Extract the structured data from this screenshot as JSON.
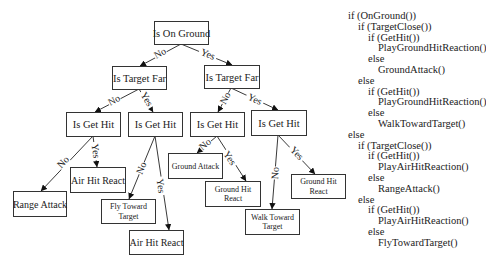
{
  "diagram": {
    "nodes": [
      {
        "id": "root",
        "lines": [
          "Is On Ground"
        ],
        "x": 154,
        "y": 21,
        "w": 54,
        "h": 23,
        "fs": 10.5
      },
      {
        "id": "far_l",
        "lines": [
          "Is Target Far"
        ],
        "x": 112,
        "y": 66,
        "w": 54,
        "h": 23,
        "fs": 10.5
      },
      {
        "id": "far_r",
        "lines": [
          "Is Target Far"
        ],
        "x": 204,
        "y": 65,
        "w": 55,
        "h": 23,
        "fs": 10.5
      },
      {
        "id": "hit_1",
        "lines": [
          "Is Get Hit"
        ],
        "x": 66,
        "y": 112,
        "w": 54,
        "h": 24,
        "fs": 10.5
      },
      {
        "id": "hit_2",
        "lines": [
          "Is Get Hit"
        ],
        "x": 128,
        "y": 112,
        "w": 54,
        "h": 24,
        "fs": 10.5
      },
      {
        "id": "hit_3",
        "lines": [
          "Is Get Hit"
        ],
        "x": 190,
        "y": 112,
        "w": 54,
        "h": 24,
        "fs": 10.5
      },
      {
        "id": "hit_4",
        "lines": [
          "Is Get Hit"
        ],
        "x": 251,
        "y": 110,
        "w": 55,
        "h": 25,
        "fs": 10.5
      },
      {
        "id": "air_hit_1",
        "lines": [
          "Air Hit React"
        ],
        "x": 70,
        "y": 167,
        "w": 55,
        "h": 25,
        "fs": 10
      },
      {
        "id": "range_attack",
        "lines": [
          "Range Attack"
        ],
        "x": 13,
        "y": 191,
        "w": 53,
        "h": 25,
        "fs": 10
      },
      {
        "id": "fly_toward",
        "lines": [
          "Fly Toward",
          "Target"
        ],
        "x": 101,
        "y": 199,
        "w": 54,
        "h": 24,
        "fs": 8
      },
      {
        "id": "air_hit_2",
        "lines": [
          "Air Hit React"
        ],
        "x": 129,
        "y": 230,
        "w": 54,
        "h": 24,
        "fs": 10
      },
      {
        "id": "ground_attack",
        "lines": [
          "Ground Attack"
        ],
        "x": 168,
        "y": 153,
        "w": 54,
        "h": 25,
        "fs": 8
      },
      {
        "id": "ground_hit_1",
        "lines": [
          "Ground Hit",
          "React"
        ],
        "x": 205,
        "y": 181,
        "w": 55,
        "h": 25,
        "fs": 8
      },
      {
        "id": "walk_toward",
        "lines": [
          "Walk Toward",
          "Target"
        ],
        "x": 245,
        "y": 209,
        "w": 54,
        "h": 25,
        "fs": 8
      },
      {
        "id": "ground_hit_2",
        "lines": [
          "Ground Hit",
          "React"
        ],
        "x": 291,
        "y": 174,
        "w": 54,
        "h": 24,
        "fs": 8
      }
    ],
    "edges": [
      {
        "from": [
          181,
          44
        ],
        "to": [
          140,
          66
        ],
        "label": "No",
        "lx": 160,
        "ly": 53
      },
      {
        "from": [
          181,
          44
        ],
        "to": [
          232,
          65
        ],
        "label": "Yes",
        "lx": 208,
        "ly": 54
      },
      {
        "from": [
          139,
          89
        ],
        "to": [
          95,
          112
        ],
        "label": "No",
        "lx": 114,
        "ly": 100
      },
      {
        "from": [
          139,
          89
        ],
        "to": [
          153,
          112
        ],
        "label": "Yes",
        "lx": 147,
        "ly": 99
      },
      {
        "from": [
          231,
          88
        ],
        "to": [
          218,
          112
        ],
        "label": "No",
        "lx": 225,
        "ly": 98
      },
      {
        "from": [
          231,
          88
        ],
        "to": [
          278,
          110
        ],
        "label": "Yes",
        "lx": 255,
        "ly": 99
      },
      {
        "from": [
          93,
          136
        ],
        "to": [
          41,
          191
        ],
        "label": "No",
        "lx": 63,
        "ly": 162
      },
      {
        "from": [
          93,
          136
        ],
        "to": [
          97,
          167
        ],
        "label": "Yes",
        "lx": 96,
        "ly": 151
      },
      {
        "from": [
          155,
          136
        ],
        "to": [
          129,
          199
        ],
        "label": "No",
        "lx": 141,
        "ly": 168
      },
      {
        "from": [
          155,
          136
        ],
        "to": [
          169,
          230
        ],
        "label": "Yes",
        "lx": 161,
        "ly": 186
      },
      {
        "from": [
          217,
          136
        ],
        "to": [
          197,
          153
        ],
        "label": "No",
        "lx": 205,
        "ly": 144
      },
      {
        "from": [
          217,
          136
        ],
        "to": [
          246,
          181
        ],
        "label": "Yes",
        "lx": 230,
        "ly": 158
      },
      {
        "from": [
          278,
          135
        ],
        "to": [
          272,
          209
        ],
        "label": "No",
        "lx": 275,
        "ly": 173
      },
      {
        "from": [
          278,
          135
        ],
        "to": [
          315,
          174
        ],
        "label": "Yes",
        "lx": 297,
        "ly": 153
      }
    ]
  },
  "code": {
    "lines": [
      {
        "indent": 0,
        "text": "if (OnGround())"
      },
      {
        "indent": 1,
        "text": "if (TargetClose())"
      },
      {
        "indent": 2,
        "text": "if (GetHit())"
      },
      {
        "indent": 3,
        "text": "PlayGroundHitReaction()"
      },
      {
        "indent": 2,
        "text": "else"
      },
      {
        "indent": 3,
        "text": "GroundAttack()"
      },
      {
        "indent": 1,
        "text": "else"
      },
      {
        "indent": 2,
        "text": "if (GetHit())"
      },
      {
        "indent": 3,
        "text": "PlayGroundHitReaction()"
      },
      {
        "indent": 2,
        "text": "else"
      },
      {
        "indent": 3,
        "text": "WalkTowardTarget()"
      },
      {
        "indent": 0,
        "text": "else"
      },
      {
        "indent": 1,
        "text": "if (TargetClose())"
      },
      {
        "indent": 2,
        "text": "if (GetHit())"
      },
      {
        "indent": 3,
        "text": "PlayAirHitReaction()"
      },
      {
        "indent": 2,
        "text": "else"
      },
      {
        "indent": 3,
        "text": "RangeAttack()"
      },
      {
        "indent": 1,
        "text": "else"
      },
      {
        "indent": 2,
        "text": "if (GetHit())"
      },
      {
        "indent": 3,
        "text": "PlayAirHitReaction()"
      },
      {
        "indent": 2,
        "text": "else"
      },
      {
        "indent": 3,
        "text": "FlyTowardTarget()"
      }
    ]
  },
  "colors": {
    "stroke": "#333333",
    "text": "#222222",
    "background": "#ffffff"
  }
}
